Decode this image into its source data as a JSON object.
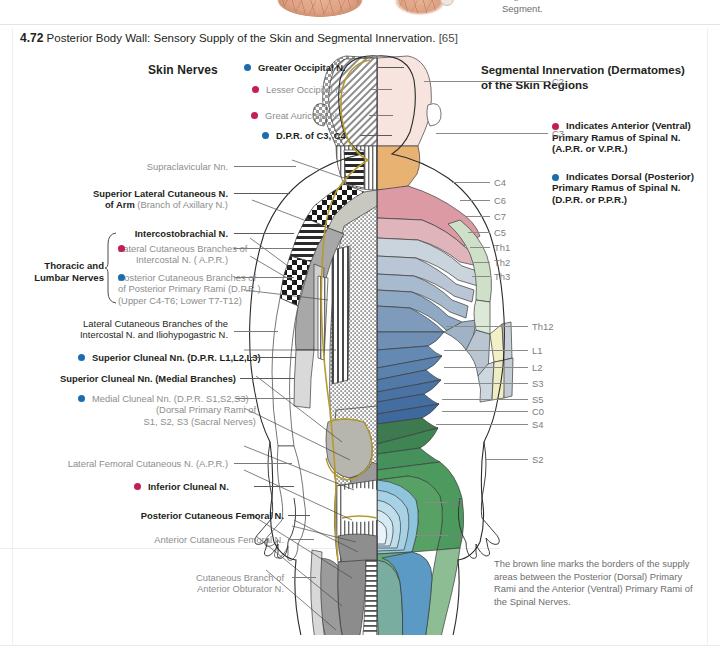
{
  "prev_figure": {
    "caption_line1": "Segments Below the 7th Thoracic",
    "caption_line2": "Segment."
  },
  "figure": {
    "number": "4.72",
    "title": "Posterior Body Wall: Sensory Supply of the Skin and Segmental Innervation.",
    "reference": "[65]"
  },
  "colors": {
    "ventral_dot": "#c51e56",
    "dorsal_dot": "#1c6cb0",
    "leader": "#5b5b5b",
    "grey_text": "#8d8d8d",
    "brown_border": "#b79a2e"
  },
  "left_column": {
    "heading": "Skin Nerves",
    "group_label_line1": "Thoracic and",
    "group_label_line2": "Lumbar Nerves",
    "items": [
      {
        "text": "Greater Occipital N.",
        "dot": "dorsal",
        "style": "bold"
      },
      {
        "text": "Lesser Occipital N.",
        "dot": "ventral",
        "style": "grey"
      },
      {
        "text": "Great Auricular N.",
        "dot": "ventral",
        "style": "grey"
      },
      {
        "text": "D.P.R. of C3, C4",
        "dot": "dorsal",
        "style": "bold"
      },
      {
        "text": "Supraclavicular Nn.",
        "dot": "none",
        "style": "grey"
      },
      {
        "text": "Superior Lateral Cutaneous N.",
        "text2": "of Arm",
        "sub2": " (Branch of Axillary N.)",
        "dot": "none",
        "style": "bold"
      },
      {
        "text": "Intercostobrachial N.",
        "dot": "none",
        "style": "bold"
      },
      {
        "text": "Lateral Cutaneous Branches of",
        "text2": "Intercostal N. ( A.P.R.)",
        "dot": "ventral",
        "style": "grey"
      },
      {
        "text": "Posterior Cutaneous Branches of",
        "text2": "of Posterior Primary Rami (D.P.R.)",
        "text3": "(Upper C4-T6; Lower T7-T12)",
        "dot": "dorsal",
        "style": "grey"
      },
      {
        "text": "Lateral Cutaneous Branches of the",
        "text2": "Intercostal N. and Iliohypogastric N.",
        "dot": "none",
        "style": "mixed"
      },
      {
        "text": "Superior Cluneal Nn. (D.P.R. L1,L2,L3)",
        "dot": "dorsal",
        "style": "bold"
      },
      {
        "text": "Superior Cluneal Nn. (Medial Branches)",
        "dot": "none",
        "style": "bold"
      },
      {
        "text": "Medial Cluneal Nn. (D.P.R. S1,S2,S3)",
        "text2": "(Dorsal Primary Rami of",
        "text3": "S1, S2, S3 (Sacral Nerves)",
        "dot": "dorsal",
        "style": "grey"
      },
      {
        "text": "Lateral Femoral Cutaneous N. (A.P.R.)",
        "dot": "none",
        "style": "grey"
      },
      {
        "text": "Inferior Cluneal N.",
        "dot": "ventral",
        "style": "bold"
      },
      {
        "text": "Posterior Cutaneous Femoral N.",
        "dot": "none",
        "style": "bold"
      },
      {
        "text": "Anterior Cutaneous Femoral N.",
        "dot": "none",
        "style": "grey"
      },
      {
        "text": "Cutaneous Branch of",
        "text2": "Anterior Obturator N.",
        "dot": "none",
        "style": "grey"
      }
    ]
  },
  "right_column": {
    "heading_line1": "Segmental Innervation (Dermatomes)",
    "heading_line2": "of the Skin Regions",
    "legend": [
      {
        "dot": "ventral",
        "line1": "Indicates Anterior (Ventral)",
        "line2": "Primary Ramus of Spinal N.",
        "line3": "(A.P.R. or V.P.R.)"
      },
      {
        "dot": "dorsal",
        "line1": "Indicates Dorsal (Posterior)",
        "line2": "Primary Ramus of Spinal N.",
        "line3": "(D.P.R. or P.P.R.)"
      }
    ],
    "note": "The brown line marks the borders of the supply areas between the Posterior (Dorsal) Primary Rami and the Anterior (Ventral) Primary Rami of the Spinal Nerves."
  },
  "dermatome_labels": [
    {
      "text": "C2",
      "x": 552,
      "y": 76,
      "lx": 424,
      "lw": 124
    },
    {
      "text": "C3",
      "x": 552,
      "y": 128,
      "lx": 436,
      "lw": 112
    },
    {
      "text": "C4",
      "x": 494,
      "y": 177,
      "lx": 452,
      "lw": 38
    },
    {
      "text": "C6",
      "x": 494,
      "y": 195,
      "lx": 460,
      "lw": 30
    },
    {
      "text": "C7",
      "x": 494,
      "y": 211,
      "lx": 466,
      "lw": 24
    },
    {
      "text": "C5",
      "x": 494,
      "y": 227,
      "lx": 468,
      "lw": 22
    },
    {
      "text": "Th1",
      "x": 494,
      "y": 242,
      "lx": 470,
      "lw": 20
    },
    {
      "text": "Th2",
      "x": 494,
      "y": 257,
      "lx": 472,
      "lw": 18
    },
    {
      "text": "Th3",
      "x": 494,
      "y": 271,
      "lx": 472,
      "lw": 18
    },
    {
      "text": "Th12",
      "x": 532,
      "y": 321,
      "lx": 446,
      "lw": 82
    },
    {
      "text": "L1",
      "x": 532,
      "y": 345,
      "lx": 444,
      "lw": 84
    },
    {
      "text": "L2",
      "x": 532,
      "y": 362,
      "lx": 444,
      "lw": 84
    },
    {
      "text": "S3",
      "x": 532,
      "y": 378,
      "lx": 444,
      "lw": 84
    },
    {
      "text": "S5",
      "x": 532,
      "y": 394,
      "lx": 442,
      "lw": 86
    },
    {
      "text": "C0",
      "x": 532,
      "y": 406,
      "lx": 442,
      "lw": 86
    },
    {
      "text": "S4",
      "x": 532,
      "y": 419,
      "lx": 436,
      "lw": 92
    },
    {
      "text": "S2",
      "x": 532,
      "y": 454,
      "lx": 486,
      "lw": 42
    },
    {
      "text": "L3",
      "x": 452,
      "y": 497,
      "lx": 424,
      "lw": 24
    },
    {
      "text": "L4",
      "x": 452,
      "y": 530,
      "lx": 416,
      "lw": 32
    }
  ]
}
